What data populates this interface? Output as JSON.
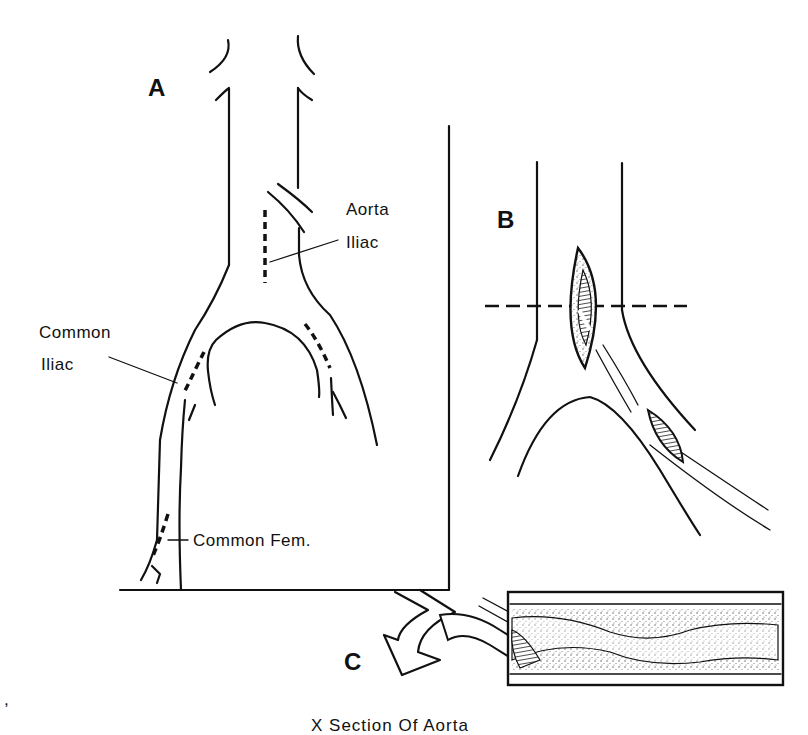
{
  "figure": {
    "panels": {
      "a": {
        "letter": "A"
      },
      "b": {
        "letter": "B"
      },
      "c": {
        "letter": "C"
      }
    },
    "labels": {
      "aorta_line1": "Aorta",
      "aorta_line2": "Iliac",
      "common_iliac_line1": "Common",
      "common_iliac_line2": "Iliac",
      "common_fem": "Common Fem."
    },
    "caption": "X Section Of Aorta",
    "stray_mark": ","
  },
  "colors": {
    "ink": "#111111",
    "background": "#ffffff",
    "stipple": "#d8d8d8"
  }
}
